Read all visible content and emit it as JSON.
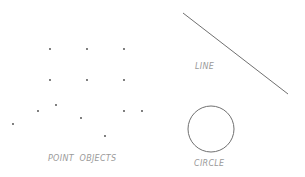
{
  "diagram": {
    "stroke_color": "#707070",
    "point_color": "#444444",
    "label_color": "#9a9a9a",
    "points": [
      {
        "x": 50,
        "y": 49
      },
      {
        "x": 87,
        "y": 49
      },
      {
        "x": 124,
        "y": 49
      },
      {
        "x": 50,
        "y": 80
      },
      {
        "x": 87,
        "y": 80
      },
      {
        "x": 124,
        "y": 80
      },
      {
        "x": 38,
        "y": 111
      },
      {
        "x": 56,
        "y": 105
      },
      {
        "x": 124,
        "y": 111
      },
      {
        "x": 142,
        "y": 111
      },
      {
        "x": 13,
        "y": 124
      },
      {
        "x": 81,
        "y": 118
      },
      {
        "x": 105,
        "y": 136
      }
    ],
    "line": {
      "x1": 183,
      "y1": 13,
      "x2": 288,
      "y2": 94
    },
    "circle": {
      "cx": 211,
      "cy": 129,
      "r": 23
    },
    "labels": {
      "points": "POINT  OBJECTS",
      "line": "LINE",
      "circle": "CIRCLE"
    }
  }
}
